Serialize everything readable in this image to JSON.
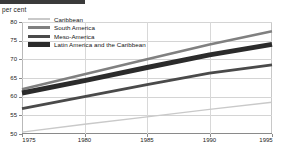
{
  "header": {
    "unit_label": "per cent",
    "rule": true
  },
  "legend": {
    "position": "top-left-inside",
    "items": [
      {
        "label": "Caribbean",
        "swatch": "line-swatch-light",
        "color": "#c9c9c9"
      },
      {
        "label": "South America",
        "swatch": "line-swatch-medium",
        "color": "#808080"
      },
      {
        "label": "Meso-America",
        "swatch": "line-swatch-dark",
        "color": "#4a4a4a"
      },
      {
        "label": "Latin America and the Caribbean",
        "swatch": "line-swatch-bold",
        "color": "#2b2b2b"
      }
    ]
  },
  "chart_data": {
    "type": "line",
    "title": "",
    "subtitle": "",
    "xlabel": "",
    "ylabel": "per cent",
    "xlim": [
      1975,
      1995
    ],
    "ylim": [
      50,
      80
    ],
    "xticks": [
      1975,
      1980,
      1985,
      1990,
      1995
    ],
    "yticks": [
      50,
      55,
      60,
      65,
      70,
      75,
      80
    ],
    "grid": true,
    "legend_position": "top-left",
    "x": [
      1975,
      1980,
      1985,
      1990,
      1995
    ],
    "series": [
      {
        "name": "Caribbean",
        "color": "#c9c9c9",
        "width": 1.4,
        "values": [
          50.5,
          52.6,
          54.6,
          56.6,
          58.5
        ]
      },
      {
        "name": "South America",
        "color": "#808080",
        "width": 2.6,
        "values": [
          62.0,
          66.0,
          70.0,
          74.0,
          77.5
        ]
      },
      {
        "name": "Meso-America",
        "color": "#4a4a4a",
        "width": 2.8,
        "values": [
          56.8,
          60.0,
          63.2,
          66.3,
          68.5
        ]
      },
      {
        "name": "Latin America and the Caribbean",
        "color": "#2b2b2b",
        "width": 5.0,
        "values": [
          61.0,
          64.3,
          67.8,
          71.2,
          74.0
        ]
      }
    ]
  }
}
